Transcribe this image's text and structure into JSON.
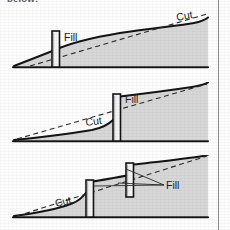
{
  "document": {
    "caption_clipped": "below:",
    "title": "Cut and fill cross sections with retaining walls"
  },
  "panels": [
    {
      "id": "panel-1",
      "name": "single-wall-low-position",
      "labels": [
        {
          "text": "Fill",
          "role": "fill-label"
        },
        {
          "text": "Cut",
          "role": "cut-label"
        }
      ],
      "walls": 1
    },
    {
      "id": "panel-2",
      "name": "single-wall-mid-position",
      "labels": [
        {
          "text": "Fill",
          "role": "fill-label"
        },
        {
          "text": "Cut",
          "role": "cut-label"
        }
      ],
      "walls": 1
    },
    {
      "id": "panel-3",
      "name": "two-wall-terraced",
      "labels": [
        {
          "text": "Fill",
          "role": "fill-label"
        },
        {
          "text": "Cut",
          "role": "cut-label"
        }
      ],
      "walls": 2
    }
  ],
  "colors": {
    "ground_fill": "#d7d7d7",
    "ground_fill_dark": "#cfcfcf",
    "outline": "#1a1a1a",
    "dashed_grade": "#2a2a2a",
    "wall_face": "#f4f4f4",
    "wall_edge": "#141414",
    "page_rule": "#8d8d8d",
    "text": "#1d1d1d"
  },
  "legend": {
    "fill_label": "Fill",
    "cut_label": "Cut"
  }
}
